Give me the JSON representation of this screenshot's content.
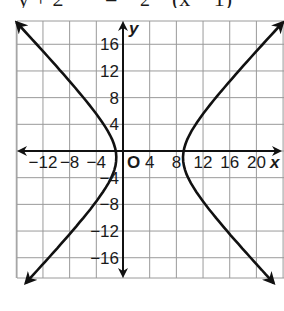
{
  "equation_fragment": {
    "lhs": "y + 2",
    "eq": "=",
    "frac_den": "2",
    "rhs": "(x − 1)"
  },
  "chart_data": {
    "type": "line",
    "title": "",
    "xlabel": "x",
    "ylabel": "y",
    "origin_label": "O",
    "xlim": [
      -16,
      24
    ],
    "ylim": [
      -19,
      20
    ],
    "grid": true,
    "grid_step": 4,
    "x_ticks": [
      "−12",
      "−8",
      "−4",
      "4",
      "8",
      "12",
      "16",
      "20"
    ],
    "x_tick_values": [
      -12,
      -8,
      -4,
      4,
      8,
      12,
      16,
      20
    ],
    "y_ticks": [
      "16",
      "12",
      "8",
      "4",
      "−4",
      "−8",
      "−12",
      "−16"
    ],
    "y_tick_values": [
      16,
      12,
      8,
      4,
      -4,
      -8,
      -12,
      -16
    ],
    "curve": {
      "kind": "hyperbola",
      "orientation": "horizontal",
      "center": [
        4,
        -1
      ],
      "a": 5,
      "b": 5.25,
      "vertices": [
        [
          -1,
          -1
        ],
        [
          9,
          -1
        ]
      ],
      "branch_endpoints_arrows": [
        [
          -15.5,
          19.5
        ],
        [
          -12,
          -19
        ],
        [
          23.5,
          19.5
        ],
        [
          20,
          -19
        ]
      ]
    }
  },
  "colors": {
    "grid": "#9a9a9a",
    "axis": "#111111",
    "curve": "#111111",
    "text": "#1a1a1a"
  }
}
